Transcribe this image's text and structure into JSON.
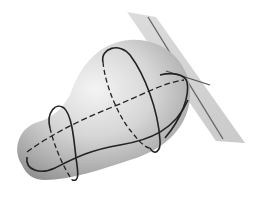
{
  "figure": {
    "colors": {
      "background": "#ffffff",
      "surface_light": "#eeeeee",
      "surface_mid": "#bdbdbd",
      "surface_dark": "#8a8a8a",
      "plane_fill": "#cfcfcf",
      "curve": "#222222",
      "plane_line": "#555555"
    },
    "elements": [
      {
        "name": "tangent-plane",
        "shape": "parallelogram"
      },
      {
        "name": "pear-surface",
        "shape": "closed-smooth-surface"
      },
      {
        "name": "large-loop-curve",
        "style": "solid-front/dashed-back"
      },
      {
        "name": "equator-curve",
        "style": "dashed"
      },
      {
        "name": "lower-curve",
        "style": "solid"
      },
      {
        "name": "small-loop-curve",
        "style": "solid-front/dashed-back"
      },
      {
        "name": "plane-line",
        "style": "solid"
      },
      {
        "name": "tangent-line",
        "style": "solid"
      }
    ]
  }
}
